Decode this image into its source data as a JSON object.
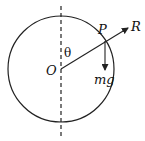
{
  "diagram": {
    "labels": {
      "center": "O",
      "point": "P",
      "reaction": "R",
      "weight": "mg",
      "angle": "θ"
    },
    "geometry": {
      "center": [
        61,
        69
      ],
      "radius": 53,
      "point_P": [
        105,
        40
      ],
      "R_tip": [
        129,
        27
      ],
      "mg_tip": [
        105,
        71
      ],
      "vertical_axis": {
        "x": 61,
        "y1": 6,
        "y2": 136,
        "style": "dashed"
      }
    },
    "colors": {
      "stroke": "#222222",
      "background": "#ffffff"
    }
  }
}
